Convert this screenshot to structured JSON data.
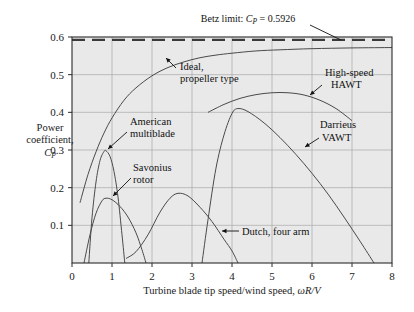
{
  "chart_data": {
    "type": "line",
    "title": "",
    "xlabel": "Turbine blade tip speed/wind speed, ωR/V",
    "ylabel_line1": "Power",
    "ylabel_line2": "coefficient,",
    "ylabel_line3": "C",
    "ylabel_line3_sub": "P",
    "xlim": [
      0,
      8
    ],
    "ylim": [
      0,
      0.6
    ],
    "xticks": [
      "0",
      "1",
      "2",
      "3",
      "4",
      "5",
      "6",
      "7",
      "8"
    ],
    "yticks": [
      "0.1",
      "0.2",
      "0.3",
      "0.4",
      "0.5",
      "0.6"
    ],
    "xtick_values": [
      0,
      1,
      2,
      3,
      4,
      5,
      6,
      7,
      8
    ],
    "ytick_values": [
      0.1,
      0.2,
      0.3,
      0.4,
      0.5,
      0.6
    ],
    "grid": true,
    "legend_position": "inline-annotations",
    "plot_bg_color": "#e9e9e9",
    "grid_color": "#a9a9a9",
    "curve_color": "#4a4a4a",
    "frame_color": "#2b2b2b",
    "betz_limit_value": 0.5926,
    "annotations": [
      {
        "name": "betz-limit",
        "text_prefix": "Betz limit: ",
        "text_var": "C",
        "text_sub": "P",
        "text_suffix": " = 0.5926"
      },
      {
        "name": "ideal-propeller",
        "line1": "Ideal,",
        "line2": "propeller type"
      },
      {
        "name": "american-multiblade",
        "line1": "American",
        "line2": "multiblade"
      },
      {
        "name": "savonius-rotor",
        "line1": "Savonius",
        "line2": "rotor"
      },
      {
        "name": "dutch-four-arm",
        "line1": "Dutch, four arm",
        "line2": ""
      },
      {
        "name": "high-speed-hawt",
        "line1": "High-speed",
        "line2": "HAWT"
      },
      {
        "name": "darrieus-vawt",
        "line1": "Darrieus",
        "line2": "VAWT"
      }
    ],
    "series": [
      {
        "name": "Betz limit",
        "style": "dashed",
        "x": [
          0,
          8
        ],
        "y": [
          0.5926,
          0.5926
        ]
      },
      {
        "name": "Ideal, propeller type",
        "style": "solid",
        "x": [
          0.2,
          0.4,
          0.6,
          0.8,
          1.0,
          1.3,
          1.6,
          2.0,
          2.4,
          2.8,
          3.2,
          3.6,
          4.0,
          4.6,
          5.2,
          6.0,
          7.0,
          8.0
        ],
        "y": [
          0.16,
          0.235,
          0.295,
          0.345,
          0.385,
          0.432,
          0.465,
          0.497,
          0.519,
          0.534,
          0.545,
          0.552,
          0.557,
          0.563,
          0.566,
          0.569,
          0.571,
          0.572
        ]
      },
      {
        "name": "American multiblade",
        "style": "solid",
        "x": [
          0.42,
          0.5,
          0.6,
          0.7,
          0.8,
          0.85,
          0.95,
          1.05,
          1.15,
          1.25,
          1.32
        ],
        "y": [
          0.0,
          0.12,
          0.215,
          0.272,
          0.296,
          0.298,
          0.283,
          0.243,
          0.175,
          0.075,
          0.0
        ]
      },
      {
        "name": "Savonius rotor",
        "style": "solid",
        "x": [
          0.3,
          0.45,
          0.6,
          0.75,
          0.85,
          1.0,
          1.2,
          1.4,
          1.6,
          1.75,
          1.85
        ],
        "y": [
          0.0,
          0.075,
          0.132,
          0.165,
          0.172,
          0.168,
          0.15,
          0.122,
          0.08,
          0.035,
          0.0
        ]
      },
      {
        "name": "Dutch, four arm",
        "style": "solid",
        "x": [
          1.35,
          1.6,
          1.9,
          2.2,
          2.45,
          2.65,
          2.9,
          3.2,
          3.5,
          3.8,
          4.0,
          4.15
        ],
        "y": [
          0.012,
          0.03,
          0.075,
          0.135,
          0.172,
          0.185,
          0.178,
          0.148,
          0.11,
          0.063,
          0.032,
          0.0
        ]
      },
      {
        "name": "High-speed HAWT",
        "style": "solid",
        "x": [
          3.4,
          3.8,
          4.2,
          4.6,
          5.0,
          5.4,
          5.8,
          6.2,
          6.6,
          7.0
        ],
        "y": [
          0.4,
          0.421,
          0.437,
          0.447,
          0.452,
          0.452,
          0.446,
          0.432,
          0.41,
          0.378
        ]
      },
      {
        "name": "Darrieus VAWT",
        "style": "solid",
        "x": [
          3.25,
          3.4,
          3.6,
          3.8,
          4.0,
          4.15,
          4.4,
          4.8,
          5.2,
          5.6,
          6.0,
          6.4,
          6.8,
          7.2,
          7.55
        ],
        "y": [
          0.0,
          0.115,
          0.252,
          0.34,
          0.397,
          0.41,
          0.402,
          0.372,
          0.333,
          0.288,
          0.238,
          0.183,
          0.122,
          0.058,
          0.0
        ]
      }
    ]
  }
}
